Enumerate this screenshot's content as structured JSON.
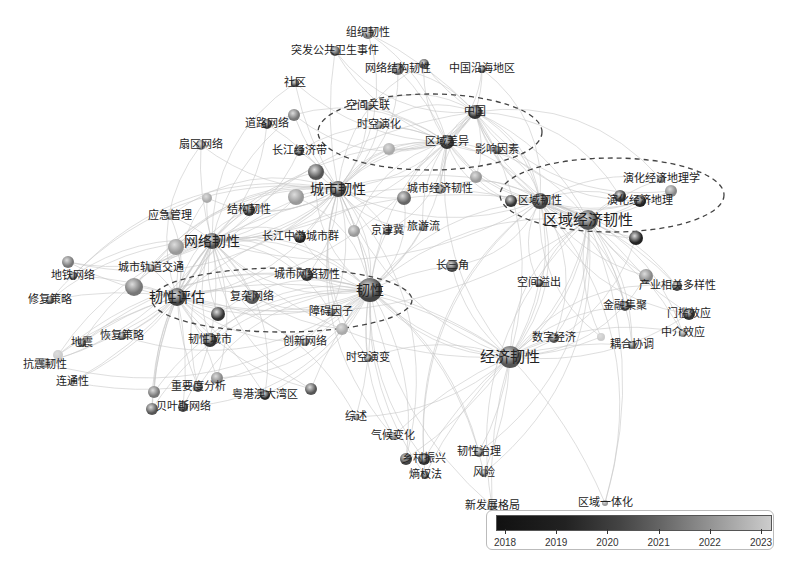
{
  "diagram": {
    "type": "keyword co-occurrence network",
    "clusters": [
      {
        "name": "cluster-china-region",
        "cx": 430,
        "cy": 132,
        "rx": 112,
        "ry": 38
      },
      {
        "name": "cluster-regional-economy",
        "cx": 612,
        "cy": 195,
        "rx": 112,
        "ry": 37
      },
      {
        "name": "cluster-resilience-assessment",
        "cx": 282,
        "cy": 300,
        "rx": 130,
        "ry": 32
      }
    ],
    "nodes": [
      {
        "id": "n1",
        "label": "组织韧性",
        "x": 368,
        "y": 33,
        "r": 6,
        "c": "#777",
        "lx": 368,
        "ly": 33
      },
      {
        "id": "n2",
        "label": "突发公共卫生事件",
        "x": 335,
        "y": 51,
        "r": 5,
        "c": "#555",
        "lx": 335,
        "ly": 51
      },
      {
        "id": "n3",
        "label": "网络结构韧性",
        "x": 398,
        "y": 69,
        "r": 6,
        "c": "#666",
        "lx": 398,
        "ly": 69
      },
      {
        "id": "n3b",
        "label": "",
        "x": 424,
        "y": 64,
        "r": 5,
        "c": "#555",
        "lx": 0,
        "ly": 0
      },
      {
        "id": "n4",
        "label": "中国沿海地区",
        "x": 482,
        "y": 69,
        "r": 4,
        "c": "#555",
        "lx": 482,
        "ly": 69
      },
      {
        "id": "n5",
        "label": "社区",
        "x": 295,
        "y": 83,
        "r": 4,
        "c": "#444",
        "lx": 295,
        "ly": 83
      },
      {
        "id": "n6",
        "label": "空间关联",
        "x": 368,
        "y": 106,
        "r": 4,
        "c": "#888",
        "lx": 368,
        "ly": 106
      },
      {
        "id": "n7",
        "label": "中国",
        "x": 475,
        "y": 112,
        "r": 7,
        "c": "#333",
        "lx": 475,
        "ly": 112
      },
      {
        "id": "n8",
        "label": "道路网络",
        "x": 267,
        "y": 124,
        "r": 5,
        "c": "#444",
        "lx": 267,
        "ly": 124
      },
      {
        "id": "n8b",
        "label": "",
        "x": 294,
        "y": 115,
        "r": 6,
        "c": "#777",
        "lx": 0,
        "ly": 0
      },
      {
        "id": "n9",
        "label": "时空演化",
        "x": 379,
        "y": 125,
        "r": 4,
        "c": "#888",
        "lx": 379,
        "ly": 125
      },
      {
        "id": "n10",
        "label": "区域差异",
        "x": 447,
        "y": 142,
        "r": 7,
        "c": "#333",
        "lx": 447,
        "ly": 142
      },
      {
        "id": "n11",
        "label": "影响因素",
        "x": 497,
        "y": 150,
        "r": 4,
        "c": "#555",
        "lx": 497,
        "ly": 150
      },
      {
        "id": "n12",
        "label": "扇区网络",
        "x": 201,
        "y": 145,
        "r": 5,
        "c": "#888",
        "lx": 201,
        "ly": 145
      },
      {
        "id": "n13",
        "label": "长江经济带",
        "x": 299,
        "y": 151,
        "r": 5,
        "c": "#444",
        "lx": 299,
        "ly": 151
      },
      {
        "id": "n13b",
        "label": "",
        "x": 389,
        "y": 149,
        "r": 6,
        "c": "#aaa",
        "lx": 0,
        "ly": 0
      },
      {
        "id": "n14",
        "label": "城市韧性",
        "x": 338,
        "y": 189,
        "r": 8,
        "c": "#444",
        "lx": 338,
        "ly": 189
      },
      {
        "id": "n14b",
        "label": "",
        "x": 316,
        "y": 172,
        "r": 8,
        "c": "#555",
        "lx": 0,
        "ly": 0
      },
      {
        "id": "n15",
        "label": "城市经济韧性",
        "x": 440,
        "y": 189,
        "r": 5,
        "c": "#888",
        "lx": 440,
        "ly": 189
      },
      {
        "id": "n15b",
        "label": "",
        "x": 476,
        "y": 177,
        "r": 6,
        "c": "#999",
        "lx": 0,
        "ly": 0
      },
      {
        "id": "n15c",
        "label": "",
        "x": 404,
        "y": 198,
        "r": 7,
        "c": "#666",
        "lx": 0,
        "ly": 0
      },
      {
        "id": "n16",
        "label": "区域韧性",
        "x": 540,
        "y": 201,
        "r": 8,
        "c": "#444",
        "lx": 540,
        "ly": 201
      },
      {
        "id": "n16b",
        "label": "",
        "x": 511,
        "y": 201,
        "r": 6,
        "c": "#333",
        "lx": 0,
        "ly": 0
      },
      {
        "id": "n17",
        "label": "演化经济地理学",
        "x": 661,
        "y": 179,
        "r": 4,
        "c": "#666",
        "lx": 661,
        "ly": 179
      },
      {
        "id": "n18",
        "label": "演化经济地理",
        "x": 640,
        "y": 201,
        "r": 6,
        "c": "#222",
        "lx": 640,
        "ly": 201
      },
      {
        "id": "n18b",
        "label": "",
        "x": 620,
        "y": 196,
        "r": 6,
        "c": "#333",
        "lx": 0,
        "ly": 0
      },
      {
        "id": "n18c",
        "label": "",
        "x": 671,
        "y": 191,
        "r": 6,
        "c": "#888",
        "lx": 0,
        "ly": 0
      },
      {
        "id": "n19",
        "label": "区域经济韧性",
        "x": 588,
        "y": 220,
        "r": 10,
        "c": "#555",
        "lx": 588,
        "ly": 220
      },
      {
        "id": "n19b",
        "label": "",
        "x": 636,
        "y": 238,
        "r": 7,
        "c": "#222",
        "lx": 0,
        "ly": 0
      },
      {
        "id": "n20",
        "label": "结构韧性",
        "x": 249,
        "y": 210,
        "r": 6,
        "c": "#333",
        "lx": 249,
        "ly": 210
      },
      {
        "id": "n20b",
        "label": "",
        "x": 296,
        "y": 197,
        "r": 8,
        "c": "#999",
        "lx": 0,
        "ly": 0
      },
      {
        "id": "n20c",
        "label": "",
        "x": 207,
        "y": 198,
        "r": 5,
        "c": "#aaa",
        "lx": 0,
        "ly": 0
      },
      {
        "id": "n21",
        "label": "应急管理",
        "x": 170,
        "y": 216,
        "r": 4,
        "c": "#999",
        "lx": 170,
        "ly": 216
      },
      {
        "id": "n22",
        "label": "京津冀",
        "x": 387,
        "y": 231,
        "r": 4,
        "c": "#555",
        "lx": 387,
        "ly": 231
      },
      {
        "id": "n23",
        "label": "旅游流",
        "x": 423,
        "y": 227,
        "r": 4,
        "c": "#888",
        "lx": 423,
        "ly": 227
      },
      {
        "id": "n24",
        "label": "网络韧性",
        "x": 212,
        "y": 241,
        "r": 8,
        "c": "#555",
        "lx": 212,
        "ly": 241
      },
      {
        "id": "n24b",
        "label": "",
        "x": 176,
        "y": 247,
        "r": 8,
        "c": "#999",
        "lx": 0,
        "ly": 0
      },
      {
        "id": "n25",
        "label": "长江中游城市群",
        "x": 300,
        "y": 237,
        "r": 6,
        "c": "#222",
        "lx": 300,
        "ly": 237
      },
      {
        "id": "n25b",
        "label": "",
        "x": 354,
        "y": 231,
        "r": 6,
        "c": "#999",
        "lx": 0,
        "ly": 0
      },
      {
        "id": "n26",
        "label": "长三角",
        "x": 452,
        "y": 266,
        "r": 6,
        "c": "#444",
        "lx": 452,
        "ly": 266
      },
      {
        "id": "n27",
        "label": "地铁网络",
        "x": 73,
        "y": 276,
        "r": 4,
        "c": "#555",
        "lx": 73,
        "ly": 276
      },
      {
        "id": "n27b",
        "label": "",
        "x": 68,
        "y": 262,
        "r": 6,
        "c": "#777",
        "lx": 0,
        "ly": 0
      },
      {
        "id": "n28",
        "label": "城市轨道交通",
        "x": 151,
        "y": 268,
        "r": 4,
        "c": "#888",
        "lx": 151,
        "ly": 268
      },
      {
        "id": "n29",
        "label": "城市网络韧性",
        "x": 307,
        "y": 275,
        "r": 6,
        "c": "#333",
        "lx": 307,
        "ly": 275
      },
      {
        "id": "n30",
        "label": "空间溢出",
        "x": 539,
        "y": 283,
        "r": 4,
        "c": "#444",
        "lx": 539,
        "ly": 283
      },
      {
        "id": "n31",
        "label": "产业相关多样性",
        "x": 677,
        "y": 286,
        "r": 5,
        "c": "#444",
        "lx": 677,
        "ly": 286
      },
      {
        "id": "n31b",
        "label": "",
        "x": 646,
        "y": 276,
        "r": 7,
        "c": "#888",
        "lx": 0,
        "ly": 0
      },
      {
        "id": "n32",
        "label": "韧性",
        "x": 370,
        "y": 290,
        "r": 12,
        "c": "#444",
        "lx": 370,
        "ly": 290
      },
      {
        "id": "n33",
        "label": "修复策略",
        "x": 50,
        "y": 300,
        "r": 4,
        "c": "#555",
        "lx": 50,
        "ly": 300
      },
      {
        "id": "n34",
        "label": "韧性评估",
        "x": 177,
        "y": 297,
        "r": 9,
        "c": "#444",
        "lx": 177,
        "ly": 297
      },
      {
        "id": "n34b",
        "label": "",
        "x": 134,
        "y": 287,
        "r": 9,
        "c": "#777",
        "lx": 0,
        "ly": 0
      },
      {
        "id": "n35",
        "label": "复杂网络",
        "x": 252,
        "y": 297,
        "r": 7,
        "c": "#555",
        "lx": 252,
        "ly": 297
      },
      {
        "id": "n35b",
        "label": "",
        "x": 218,
        "y": 314,
        "r": 7,
        "c": "#333",
        "lx": 0,
        "ly": 0
      },
      {
        "id": "n36",
        "label": "金融集聚",
        "x": 625,
        "y": 306,
        "r": 5,
        "c": "#555",
        "lx": 625,
        "ly": 306
      },
      {
        "id": "n37",
        "label": "门槛效应",
        "x": 689,
        "y": 314,
        "r": 6,
        "c": "#333",
        "lx": 689,
        "ly": 314
      },
      {
        "id": "n38",
        "label": "障碍因子",
        "x": 331,
        "y": 312,
        "r": 4,
        "c": "#666",
        "lx": 331,
        "ly": 312
      },
      {
        "id": "n38b",
        "label": "",
        "x": 342,
        "y": 329,
        "r": 6,
        "c": "#aaa",
        "lx": 0,
        "ly": 0
      },
      {
        "id": "n39",
        "label": "恢复策略",
        "x": 122,
        "y": 336,
        "r": 4,
        "c": "#555",
        "lx": 122,
        "ly": 336
      },
      {
        "id": "n40",
        "label": "韧性城市",
        "x": 210,
        "y": 340,
        "r": 7,
        "c": "#333",
        "lx": 210,
        "ly": 340
      },
      {
        "id": "n41",
        "label": "中介效应",
        "x": 683,
        "y": 333,
        "r": 4,
        "c": "#888",
        "lx": 683,
        "ly": 333
      },
      {
        "id": "n42",
        "label": "创新网络",
        "x": 305,
        "y": 342,
        "r": 4,
        "c": "#777",
        "lx": 305,
        "ly": 342
      },
      {
        "id": "n43",
        "label": "数字经济",
        "x": 554,
        "y": 338,
        "r": 5,
        "c": "#555",
        "lx": 554,
        "ly": 338
      },
      {
        "id": "n43b",
        "label": "",
        "x": 601,
        "y": 337,
        "r": 4,
        "c": "#ccc",
        "lx": 0,
        "ly": 0
      },
      {
        "id": "n44",
        "label": "耦合协调",
        "x": 632,
        "y": 345,
        "r": 4,
        "c": "#666",
        "lx": 632,
        "ly": 345
      },
      {
        "id": "n45",
        "label": "地震",
        "x": 82,
        "y": 343,
        "r": 4,
        "c": "#555",
        "lx": 82,
        "ly": 343
      },
      {
        "id": "n46",
        "label": "抗震韧性",
        "x": 45,
        "y": 363,
        "r": 5,
        "c": "#999",
        "lx": 45,
        "ly": 365
      },
      {
        "id": "n46b",
        "label": "",
        "x": 58,
        "y": 355,
        "r": 5,
        "c": "#ccc",
        "lx": 0,
        "ly": 0
      },
      {
        "id": "n47",
        "label": "经济韧性",
        "x": 510,
        "y": 357,
        "r": 11,
        "c": "#555",
        "lx": 510,
        "ly": 357
      },
      {
        "id": "n48",
        "label": "时空演变",
        "x": 368,
        "y": 358,
        "r": 4,
        "c": "#666",
        "lx": 368,
        "ly": 358
      },
      {
        "id": "n49",
        "label": "连通性",
        "x": 72,
        "y": 382,
        "r": 3,
        "c": "#999",
        "lx": 72,
        "ly": 382
      },
      {
        "id": "n50",
        "label": "重要度分析",
        "x": 198,
        "y": 387,
        "r": 5,
        "c": "#555",
        "lx": 198,
        "ly": 387
      },
      {
        "id": "n50b",
        "label": "",
        "x": 217,
        "y": 378,
        "r": 6,
        "c": "#888",
        "lx": 0,
        "ly": 0
      },
      {
        "id": "n50c",
        "label": "",
        "x": 154,
        "y": 392,
        "r": 6,
        "c": "#777",
        "lx": 0,
        "ly": 0
      },
      {
        "id": "n51",
        "label": "粤港澳大湾区",
        "x": 265,
        "y": 395,
        "r": 5,
        "c": "#333",
        "lx": 265,
        "ly": 395
      },
      {
        "id": "n51b",
        "label": "",
        "x": 311,
        "y": 389,
        "r": 6,
        "c": "#555",
        "lx": 0,
        "ly": 0
      },
      {
        "id": "n52",
        "label": "贝叶斯网络",
        "x": 183,
        "y": 407,
        "r": 5,
        "c": "#444",
        "lx": 183,
        "ly": 407
      },
      {
        "id": "n52b",
        "label": "",
        "x": 152,
        "y": 409,
        "r": 6,
        "c": "#555",
        "lx": 0,
        "ly": 0
      },
      {
        "id": "n53",
        "label": "综述",
        "x": 356,
        "y": 417,
        "r": 3,
        "c": "#888",
        "lx": 356,
        "ly": 417
      },
      {
        "id": "n54",
        "label": "气候变化",
        "x": 393,
        "y": 436,
        "r": 4,
        "c": "#888",
        "lx": 393,
        "ly": 436
      },
      {
        "id": "n55",
        "label": "韧性治理",
        "x": 479,
        "y": 452,
        "r": 5,
        "c": "#666",
        "lx": 479,
        "ly": 452
      },
      {
        "id": "n56",
        "label": "乡村振兴",
        "x": 424,
        "y": 459,
        "r": 6,
        "c": "#333",
        "lx": 424,
        "ly": 459
      },
      {
        "id": "n56b",
        "label": "",
        "x": 406,
        "y": 459,
        "r": 6,
        "c": "#444",
        "lx": 0,
        "ly": 0
      },
      {
        "id": "n57",
        "label": "熵权法",
        "x": 425,
        "y": 475,
        "r": 4,
        "c": "#555",
        "lx": 425,
        "ly": 475
      },
      {
        "id": "n58",
        "label": "风险",
        "x": 484,
        "y": 473,
        "r": 4,
        "c": "#777",
        "lx": 484,
        "ly": 473
      },
      {
        "id": "n59",
        "label": "新发展格局",
        "x": 492,
        "y": 506,
        "r": 5,
        "c": "#aaa",
        "lx": 492,
        "ly": 506
      },
      {
        "id": "n60",
        "label": "区域一体化",
        "x": 605,
        "y": 503,
        "r": 3,
        "c": "#999",
        "lx": 605,
        "ly": 503
      }
    ],
    "large_labels": [
      "区域经济韧性",
      "经济韧性",
      "韧性",
      "韧性评估",
      "网络韧性",
      "城市韧性"
    ],
    "hubs": [
      "n32",
      "n47",
      "n19",
      "n14",
      "n34",
      "n24",
      "n7",
      "n10",
      "n16"
    ]
  },
  "legend": {
    "title": "",
    "years": [
      "2018",
      "2019",
      "2020",
      "2021",
      "2022",
      "2023"
    ],
    "gradient": [
      "#111111",
      "#cccccc"
    ]
  },
  "caption": ""
}
